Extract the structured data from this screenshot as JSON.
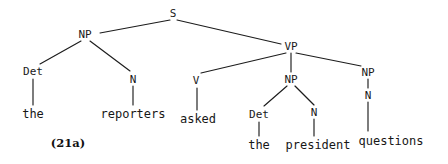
{
  "figure": {
    "example_label": "(21a)",
    "sentence": "the reporters asked the president questions",
    "ink_color": "#1c1c1c"
  },
  "nodes": [
    {
      "id": "S",
      "label": "S",
      "x": 173,
      "y": 13
    },
    {
      "id": "NP_subj",
      "label": "NP",
      "x": 85,
      "y": 34
    },
    {
      "id": "VP",
      "label": "VP",
      "x": 291,
      "y": 46
    },
    {
      "id": "Det1",
      "label": "Det",
      "x": 33,
      "y": 71
    },
    {
      "id": "N1",
      "label": "N",
      "x": 133,
      "y": 79
    },
    {
      "id": "V",
      "label": "V",
      "x": 196,
      "y": 80
    },
    {
      "id": "NP_obj",
      "label": "NP",
      "x": 291,
      "y": 79
    },
    {
      "id": "NP_obj2",
      "label": "NP",
      "x": 368,
      "y": 72
    },
    {
      "id": "Det2",
      "label": "Det",
      "x": 259,
      "y": 114
    },
    {
      "id": "N2",
      "label": "N",
      "x": 314,
      "y": 112
    },
    {
      "id": "N3",
      "label": "N",
      "x": 368,
      "y": 95
    }
  ],
  "terminals": [
    {
      "id": "w_the1",
      "label": "the",
      "x": 33,
      "y": 114
    },
    {
      "id": "w_reporters",
      "label": "reporters",
      "x": 133,
      "y": 114
    },
    {
      "id": "w_asked",
      "label": "asked",
      "x": 198,
      "y": 119
    },
    {
      "id": "w_the2",
      "label": "the",
      "x": 259,
      "y": 145
    },
    {
      "id": "w_president",
      "label": "president",
      "x": 318,
      "y": 145
    },
    {
      "id": "w_questions",
      "label": "questions",
      "x": 391,
      "y": 141
    }
  ],
  "edges": [
    {
      "from": "S",
      "to": "NP_subj",
      "x1": 170,
      "y1": 20,
      "x2": 100,
      "y2": 33
    },
    {
      "from": "S",
      "to": "VP",
      "x1": 177,
      "y1": 20,
      "x2": 281,
      "y2": 44
    },
    {
      "from": "NP_subj",
      "to": "Det1",
      "x1": 81,
      "y1": 41,
      "x2": 40,
      "y2": 64
    },
    {
      "from": "NP_subj",
      "to": "N1",
      "x1": 90,
      "y1": 41,
      "x2": 130,
      "y2": 71
    },
    {
      "from": "VP",
      "to": "V",
      "x1": 286,
      "y1": 53,
      "x2": 201,
      "y2": 73
    },
    {
      "from": "VP",
      "to": "NP_obj",
      "x1": 291,
      "y1": 53,
      "x2": 291,
      "y2": 72
    },
    {
      "from": "VP",
      "to": "NP_obj2",
      "x1": 296,
      "y1": 53,
      "x2": 361,
      "y2": 66
    },
    {
      "from": "Det1",
      "to": "w_the1",
      "x1": 33,
      "y1": 79,
      "x2": 33,
      "y2": 105
    },
    {
      "from": "N1",
      "to": "w_rep",
      "x1": 133,
      "y1": 86,
      "x2": 133,
      "y2": 105
    },
    {
      "from": "V",
      "to": "w_asked",
      "x1": 197,
      "y1": 88,
      "x2": 197,
      "y2": 110
    },
    {
      "from": "NP_obj",
      "to": "Det2",
      "x1": 287,
      "y1": 86,
      "x2": 264,
      "y2": 106
    },
    {
      "from": "NP_obj",
      "to": "N2",
      "x1": 295,
      "y1": 86,
      "x2": 314,
      "y2": 105
    },
    {
      "from": "NP_obj2",
      "to": "N3",
      "x1": 368,
      "y1": 79,
      "x2": 368,
      "y2": 88
    },
    {
      "from": "Det2",
      "to": "w_the2",
      "x1": 259,
      "y1": 122,
      "x2": 259,
      "y2": 136
    },
    {
      "from": "N2",
      "to": "w_pres",
      "x1": 314,
      "y1": 119,
      "x2": 314,
      "y2": 136
    },
    {
      "from": "N3",
      "to": "w_quest",
      "x1": 368,
      "y1": 102,
      "x2": 368,
      "y2": 131
    }
  ]
}
